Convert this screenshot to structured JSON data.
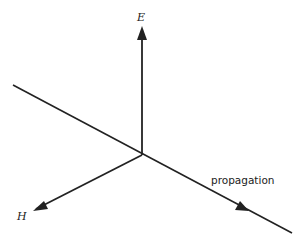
{
  "diagram": {
    "labels": {
      "e_field": "E",
      "h_field": "H",
      "propagation": "propagation"
    },
    "colors": {
      "line": "#222222",
      "background": "#ffffff"
    },
    "geometry": {
      "origin": [
        142,
        155
      ],
      "e_arrow_tip": [
        142,
        28
      ],
      "h_arrow_tip": [
        33,
        211
      ],
      "propagation_line_start": [
        13,
        85
      ],
      "propagation_arrow_tip": [
        247,
        210
      ],
      "propagation_line_end": [
        292,
        233
      ]
    }
  }
}
